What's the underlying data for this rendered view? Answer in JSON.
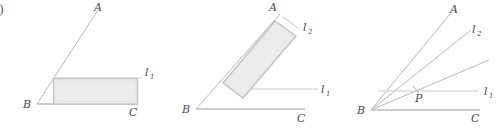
{
  "figure": {
    "caption_fragment": ")",
    "panels": [
      {
        "id": "panel-1",
        "vertex_label": "B",
        "ray_a_label": "A",
        "ray_c_label": "C",
        "line_labels": [
          "l",
          "1"
        ],
        "shape": "rectangle-axis-aligned",
        "description": "Rectangle inscribed in angle ABC with top side on line l1"
      },
      {
        "id": "panel-2",
        "vertex_label": "B",
        "ray_a_label": "A",
        "ray_c_label": "C",
        "line_labels_1": [
          "l",
          "1"
        ],
        "line_labels_2": [
          "l",
          "2"
        ],
        "shape": "rectangle-rotated",
        "description": "Rotated rectangle along ray BA with lines l1 and l2"
      },
      {
        "id": "panel-3",
        "vertex_label": "B",
        "ray_a_label": "A",
        "ray_c_label": "C",
        "point_label": "P",
        "line_labels_1": [
          "l",
          "1"
        ],
        "line_labels_2": [
          "l",
          "2"
        ],
        "shape": "ray-pencil",
        "description": "Pencil of rays from B crossing line l1 at point P"
      }
    ],
    "colors": {
      "ray": "#b9b9b9",
      "baseline": "#bdbdbd",
      "rect_fill": "#ececec",
      "rect_stroke": "#c2c2c2",
      "label": "#4a4a4a",
      "background": "#ffffff"
    }
  }
}
